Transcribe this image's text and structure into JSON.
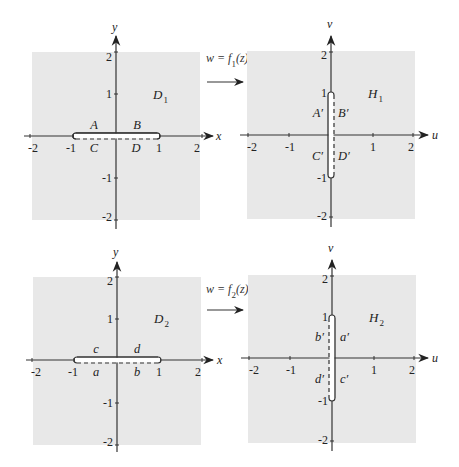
{
  "panels": {
    "d1": {
      "region_label": "D",
      "region_sub": "1",
      "axis_h": "x",
      "axis_v": "y",
      "ticks_h": [
        "-2",
        "-1",
        "1",
        "2"
      ],
      "ticks_v": [
        "2",
        "1",
        "-1",
        "-2"
      ],
      "slit_labels": {
        "top_left": "A",
        "top_right": "B",
        "bottom_left": "C",
        "bottom_right": "D"
      },
      "slit": {
        "orientation": "horizontal",
        "from": -1,
        "to": 1,
        "solid_side": "top",
        "dashed_side": "bottom"
      }
    },
    "h1": {
      "region_label": "H",
      "region_sub": "1",
      "axis_h": "u",
      "axis_v": "v",
      "ticks_h": [
        "-2",
        "-1",
        "1",
        "2"
      ],
      "ticks_v": [
        "2",
        "1",
        "-1",
        "-2"
      ],
      "slit_labels": {
        "upper_left": "A′",
        "upper_right": "B′",
        "lower_left": "C′",
        "lower_right": "D′"
      },
      "slit": {
        "orientation": "vertical",
        "from": -1,
        "to": 1,
        "solid_side": "left",
        "dashed_side": "right"
      }
    },
    "d2": {
      "region_label": "D",
      "region_sub": "2",
      "axis_h": "x",
      "axis_v": "y",
      "ticks_h": [
        "-2",
        "-1",
        "1",
        "2"
      ],
      "ticks_v": [
        "2",
        "1",
        "-1",
        "-2"
      ],
      "slit_labels": {
        "top_left": "c",
        "top_right": "d",
        "bottom_left": "a",
        "bottom_right": "b"
      },
      "slit": {
        "orientation": "horizontal",
        "from": -1,
        "to": 1,
        "solid_side": "top",
        "dashed_side": "bottom"
      }
    },
    "h2": {
      "region_label": "H",
      "region_sub": "2",
      "axis_h": "u",
      "axis_v": "v",
      "ticks_h": [
        "-2",
        "-1",
        "1",
        "2"
      ],
      "ticks_v": [
        "2",
        "1",
        "-1",
        "-2"
      ],
      "slit_labels": {
        "upper_left": "b′",
        "upper_right": "a′",
        "lower_left": "d′",
        "lower_right": "c′"
      },
      "slit": {
        "orientation": "vertical",
        "from": -1,
        "to": 1,
        "solid_side": "right",
        "dashed_side": "left"
      }
    }
  },
  "mappings": [
    {
      "lhs": "w = f",
      "sub": "1",
      "rhs": "(z)"
    },
    {
      "lhs": "w = f",
      "sub": "2",
      "rhs": "(z)"
    }
  ],
  "colors": {
    "panel_fill": "#e8e8e8",
    "axis": "#333333",
    "text": "#222222"
  }
}
